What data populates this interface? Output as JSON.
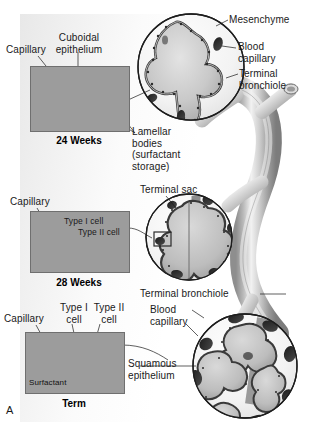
{
  "figure": {
    "panel_label": "A",
    "accent_color": "#1a1a1a",
    "panel_color": "#f2f2f2"
  },
  "insets": [
    {
      "id": "inset-24-weeks",
      "caption": "24 Weeks",
      "labels": [
        {
          "name": "capillary",
          "text": "Capillary"
        },
        {
          "name": "cuboidal-epithelium",
          "text": "Cuboidal\nepithelium"
        },
        {
          "name": "lamellar-bodies",
          "text": "Lamellar\nbodies\n(surfactant\nstorage)"
        }
      ]
    },
    {
      "id": "inset-28-weeks",
      "caption": "28 Weeks",
      "labels": [
        {
          "name": "capillary",
          "text": "Capillary"
        },
        {
          "name": "type-i-cell",
          "text": "Type I cell"
        },
        {
          "name": "type-ii-cell",
          "text": "Type II cell"
        }
      ]
    },
    {
      "id": "inset-term",
      "caption": "Term",
      "labels": [
        {
          "name": "capillary",
          "text": "Capillary"
        },
        {
          "name": "type-i-cell",
          "text": "Type I\ncell"
        },
        {
          "name": "type-ii-cell",
          "text": "Type II\ncell"
        },
        {
          "name": "surfactant",
          "text": "Surfactant"
        }
      ]
    }
  ],
  "circles": [
    {
      "id": "circle-canalicular",
      "labels": [
        {
          "name": "mesenchyme",
          "text": "Mesenchyme"
        },
        {
          "name": "blood-capillary",
          "text": "Blood\ncapillary"
        },
        {
          "name": "terminal-bronchiole",
          "text": "Terminal\nbronchiole"
        }
      ]
    },
    {
      "id": "circle-saccular",
      "labels": [
        {
          "name": "terminal-sac",
          "text": "Terminal sac"
        }
      ]
    },
    {
      "id": "circle-alveolar",
      "labels": [
        {
          "name": "terminal-bronchiole",
          "text": "Terminal bronchiole"
        },
        {
          "name": "blood-capillary",
          "text": "Blood\ncapillary"
        },
        {
          "name": "squamous-epithelium",
          "text": "Squamous\nepithelium"
        }
      ]
    }
  ],
  "labels": {
    "capillary_24": "Capillary",
    "cuboidal_epithelium": "Cuboidal\nepithelium",
    "lamellar_bodies": "Lamellar\nbodies\n(surfactant\nstorage)",
    "caption_24_weeks": "24 Weeks",
    "capillary_28": "Capillary",
    "type_i_cell_28": "Type I cell",
    "type_ii_cell_28": "Type II cell",
    "caption_28_weeks": "28 Weeks",
    "capillary_term": "Capillary",
    "type_i_cell_term": "Type I\ncell",
    "type_ii_cell_term": "Type II\ncell",
    "surfactant_term": "Surfactant",
    "caption_term": "Term",
    "mesenchyme": "Mesenchyme",
    "blood_capillary_top": "Blood\ncapillary",
    "terminal_bronchiole_top": "Terminal\nbronchiole",
    "terminal_sac": "Terminal sac",
    "terminal_bronchiole_bottom": "Terminal bronchiole",
    "blood_capillary_bottom": "Blood\ncapillary",
    "squamous_epithelium": "Squamous\nepithelium",
    "figure_letter": "A"
  }
}
